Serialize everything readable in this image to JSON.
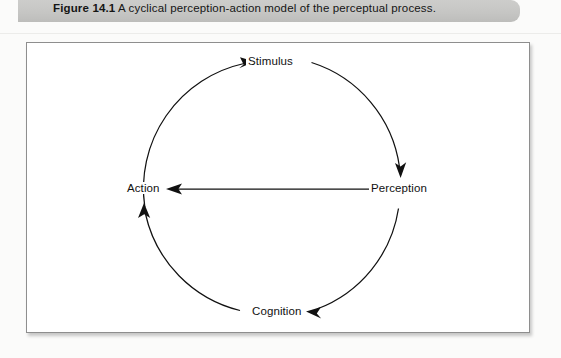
{
  "caption": {
    "label": "Figure 14.1",
    "body": " A cyclical perception-action model of the perceptual process.",
    "bar_color": "#c6c6c4"
  },
  "figure": {
    "frame_color": "#8e8e8e",
    "background": "#ffffff",
    "ink_color": "#111111"
  },
  "diagram": {
    "type": "cycle",
    "nodes": [
      {
        "id": "stimulus",
        "label": "Stimulus",
        "position": "top"
      },
      {
        "id": "perception",
        "label": "Perception",
        "position": "right"
      },
      {
        "id": "cognition",
        "label": "Cognition",
        "position": "bottom"
      },
      {
        "id": "action",
        "label": "Action",
        "position": "left"
      }
    ],
    "edges": [
      {
        "from": "action",
        "to": "stimulus",
        "shape": "arc",
        "arrowhead": "stimulus"
      },
      {
        "from": "stimulus",
        "to": "perception",
        "shape": "arc",
        "arrowhead": "perception"
      },
      {
        "from": "perception",
        "to": "cognition",
        "shape": "arc",
        "arrowhead": "cognition"
      },
      {
        "from": "cognition",
        "to": "action",
        "shape": "arc",
        "arrowhead": "action"
      },
      {
        "from": "perception",
        "to": "action",
        "shape": "straight",
        "arrowhead": "action"
      }
    ]
  }
}
